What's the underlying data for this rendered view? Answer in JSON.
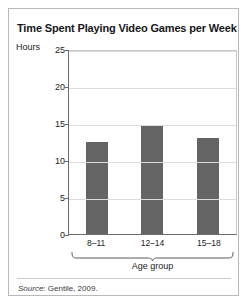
{
  "figure": {
    "title": "Time Spent Playing Video Games per Week",
    "source_prefix": "Source",
    "source_text": ": Gentile, 2009."
  },
  "chart_data": {
    "type": "bar",
    "title": "Time Spent Playing Video Games per Week",
    "categories": [
      "8–11",
      "12–14",
      "15–18"
    ],
    "values": [
      12.5,
      14.7,
      13.0
    ],
    "series": [
      {
        "name": "Hours per week",
        "values": [
          12.5,
          14.7,
          13.0
        ]
      }
    ],
    "xlabel": "Age group",
    "ylabel": "Hours",
    "ylim": [
      0,
      25
    ],
    "yticks": [
      0,
      5,
      10,
      15,
      20,
      25
    ],
    "ytick_labels": [
      "0",
      "5",
      "10",
      "15",
      "20",
      "25"
    ],
    "grid": "horizontal",
    "legend": "none",
    "bar_color": "#646464",
    "gridline_color": "#dcdcdc",
    "axis_color": "#6a6a6a"
  }
}
